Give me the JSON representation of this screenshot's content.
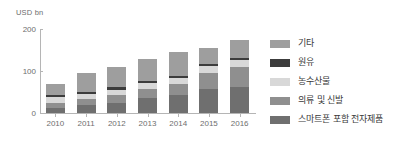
{
  "chart_data": {
    "type": "bar",
    "stacked": true,
    "title": "",
    "subtitle": "",
    "xlabel": "",
    "ylabel": "USD bn",
    "ylim": [
      0,
      200
    ],
    "yticks": [
      0,
      100,
      200
    ],
    "ytick_labels": [
      "0",
      "100",
      "200"
    ],
    "grid": false,
    "legend_position": "right",
    "categories": [
      "2010",
      "2011",
      "2012",
      "2013",
      "2014",
      "2015",
      "2016"
    ],
    "series": [
      {
        "name": "스마트폰 포함 전자제품",
        "color": "#6f6f6f",
        "values": [
          13,
          18,
          25,
          35,
          42,
          56,
          63
        ]
      },
      {
        "name": "의류 및 신발",
        "color": "#8f8f8f",
        "values": [
          12,
          15,
          18,
          22,
          26,
          40,
          47
        ]
      },
      {
        "name": "농수산물",
        "color": "#d8d8d8",
        "values": [
          12,
          13,
          13,
          15,
          15,
          15,
          16
        ]
      },
      {
        "name": "원유",
        "color": "#3c3c3c",
        "values": [
          5,
          5,
          5,
          5,
          5,
          5,
          5
        ]
      },
      {
        "name": "기타",
        "color": "#9e9e9e",
        "values": [
          28,
          44,
          49,
          51,
          57,
          40,
          42
        ]
      }
    ],
    "totals": [
      70,
      95,
      110,
      128,
      145,
      156,
      173
    ],
    "legend_entries": [
      {
        "label": "기타",
        "color": "#9e9e9e"
      },
      {
        "label": "원유",
        "color": "#3c3c3c"
      },
      {
        "label": "농수산물",
        "color": "#d8d8d8"
      },
      {
        "label": "의류 및 신발",
        "color": "#8f8f8f"
      },
      {
        "label": "스마트폰 포함 전자제품",
        "color": "#6f6f6f"
      }
    ]
  },
  "axis": {
    "y_title": "USD bn",
    "y_tick_labels": [
      "200",
      "100",
      "0"
    ],
    "x_tick_labels": [
      "2010",
      "2011",
      "2012",
      "2013",
      "2014",
      "2015",
      "2016"
    ]
  },
  "colors": {
    "axis_line": "#b5b5b5",
    "tick_text": "#6e6e6e",
    "legend_text": "#3a3a3a",
    "background": "#ffffff"
  }
}
